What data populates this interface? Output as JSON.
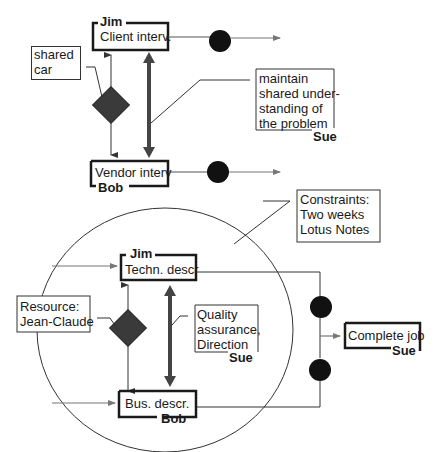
{
  "top_process": {
    "upper_task": {
      "owner": "Jim",
      "label": "Client interv."
    },
    "lower_task": {
      "owner": "Bob",
      "label": "Vendor interv"
    },
    "resource_note": {
      "lines": [
        "shared",
        "car"
      ]
    },
    "coordination_note": {
      "lines": [
        "maintain",
        "shared under-",
        "standing of",
        "the problem"
      ],
      "owner": "Sue"
    }
  },
  "bottom_process": {
    "constraints_note": {
      "lines": [
        "Constraints:",
        "Two weeks",
        "Lotus Notes"
      ]
    },
    "upper_task": {
      "owner": "Jim",
      "label": "Techn. descr"
    },
    "lower_task": {
      "owner": "Bob",
      "label": "Bus. descr."
    },
    "resource_note": {
      "lines": [
        "Resource:",
        "Jean-Claude"
      ]
    },
    "coordination_note": {
      "lines": [
        "Quality",
        "assurance,",
        "Direction"
      ],
      "owner": "Sue"
    },
    "final_task": {
      "owner": "Sue",
      "label": "Complete job"
    }
  },
  "colors": {
    "ink": "#1a1a1a",
    "diamond": "#3a3a3a",
    "arrow_gray": "#777777",
    "double_arrow": "#444444"
  }
}
